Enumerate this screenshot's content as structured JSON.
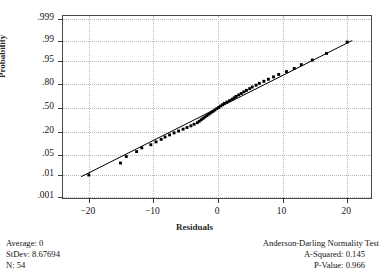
{
  "chart_data": {
    "type": "scatter",
    "title": "",
    "xlabel": "Residuals",
    "ylabel": "Probability",
    "xlim": [
      -24.0,
      24.0
    ],
    "ylim_prob": [
      0.0007,
      0.9993
    ],
    "grid": true,
    "legend": "none",
    "xticks": [
      -20,
      -10,
      0,
      10,
      20
    ],
    "xtick_labels": [
      "−20",
      "−10",
      "0",
      "10",
      "20"
    ],
    "yticks": [
      0.999,
      0.99,
      0.95,
      0.8,
      0.5,
      0.2,
      0.05,
      0.01,
      0.001
    ],
    "ytick_labels": [
      ".999",
      ".99",
      ".95",
      ".80",
      ".50",
      ".20",
      ".05",
      ".01",
      ".001"
    ],
    "fit_line": {
      "x": [
        -21.2,
        20.8
      ],
      "prob": [
        0.0085,
        0.9905
      ],
      "color": "#000000"
    },
    "points": [
      {
        "x": -20.0,
        "p": 0.01
      },
      {
        "x": -15.1,
        "p": 0.028
      },
      {
        "x": -14.2,
        "p": 0.046
      },
      {
        "x": -12.6,
        "p": 0.065
      },
      {
        "x": -11.8,
        "p": 0.083
      },
      {
        "x": -10.4,
        "p": 0.101
      },
      {
        "x": -9.6,
        "p": 0.12
      },
      {
        "x": -8.8,
        "p": 0.138
      },
      {
        "x": -8.2,
        "p": 0.157
      },
      {
        "x": -7.5,
        "p": 0.175
      },
      {
        "x": -6.8,
        "p": 0.194
      },
      {
        "x": -6.1,
        "p": 0.212
      },
      {
        "x": -5.4,
        "p": 0.231
      },
      {
        "x": -4.8,
        "p": 0.249
      },
      {
        "x": -4.2,
        "p": 0.268
      },
      {
        "x": -3.7,
        "p": 0.286
      },
      {
        "x": -3.2,
        "p": 0.305
      },
      {
        "x": -2.9,
        "p": 0.323
      },
      {
        "x": -2.6,
        "p": 0.342
      },
      {
        "x": -2.3,
        "p": 0.36
      },
      {
        "x": -2.0,
        "p": 0.379
      },
      {
        "x": -1.7,
        "p": 0.397
      },
      {
        "x": -1.4,
        "p": 0.416
      },
      {
        "x": -1.1,
        "p": 0.434
      },
      {
        "x": -0.8,
        "p": 0.453
      },
      {
        "x": -0.5,
        "p": 0.471
      },
      {
        "x": -0.2,
        "p": 0.49
      },
      {
        "x": 0.1,
        "p": 0.508
      },
      {
        "x": 0.4,
        "p": 0.527
      },
      {
        "x": 0.7,
        "p": 0.545
      },
      {
        "x": 1.0,
        "p": 0.564
      },
      {
        "x": 1.4,
        "p": 0.582
      },
      {
        "x": 1.8,
        "p": 0.601
      },
      {
        "x": 2.2,
        "p": 0.619
      },
      {
        "x": 2.5,
        "p": 0.638
      },
      {
        "x": 2.8,
        "p": 0.656
      },
      {
        "x": 3.2,
        "p": 0.675
      },
      {
        "x": 3.6,
        "p": 0.693
      },
      {
        "x": 4.0,
        "p": 0.712
      },
      {
        "x": 4.4,
        "p": 0.73
      },
      {
        "x": 4.9,
        "p": 0.749
      },
      {
        "x": 5.3,
        "p": 0.767
      },
      {
        "x": 5.9,
        "p": 0.786
      },
      {
        "x": 6.4,
        "p": 0.804
      },
      {
        "x": 7.1,
        "p": 0.823
      },
      {
        "x": 7.8,
        "p": 0.841
      },
      {
        "x": 8.6,
        "p": 0.86
      },
      {
        "x": 9.4,
        "p": 0.878
      },
      {
        "x": 10.6,
        "p": 0.897
      },
      {
        "x": 11.8,
        "p": 0.915
      },
      {
        "x": 12.9,
        "p": 0.934
      },
      {
        "x": 14.6,
        "p": 0.952
      },
      {
        "x": 16.8,
        "p": 0.971
      },
      {
        "x": 20.0,
        "p": 0.989
      }
    ]
  },
  "stats_left": {
    "average": "Average: 0",
    "stdev": "StDev: 8.67694",
    "n": "N: 54"
  },
  "stats_right": {
    "test_title": "Anderson-Darling Normality Test",
    "a_squared": "A-Squared: 0.145",
    "p_value": "P-Value:   0.966"
  }
}
